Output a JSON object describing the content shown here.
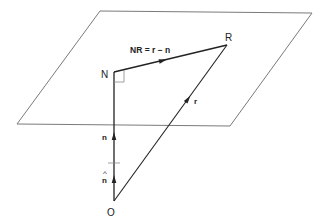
{
  "diagram": {
    "plane": {
      "corners": [
        [
          100,
          11
        ],
        [
          312,
          13
        ],
        [
          230,
          126
        ],
        [
          17,
          124
        ]
      ],
      "stroke": "#7a7a7a"
    },
    "points": {
      "N": {
        "label": "N",
        "x": 114,
        "y": 72
      },
      "R": {
        "label": "R",
        "x": 227,
        "y": 45
      },
      "O": {
        "label": "O",
        "x": 114,
        "y": 201
      }
    },
    "vectors": {
      "NR": {
        "label": "NR = r − n",
        "from": "N",
        "to": "R"
      },
      "r": {
        "label": "r",
        "from": "O",
        "to": "R"
      },
      "n": {
        "label": "n",
        "from": "O",
        "to": "N"
      },
      "n_hat": {
        "label": "n",
        "hat": "^",
        "from": "O",
        "to": "tick"
      }
    },
    "right_angle_marker": {
      "at": "N"
    },
    "line_color": "#222222"
  }
}
